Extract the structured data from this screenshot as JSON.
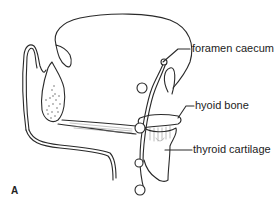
{
  "figure": {
    "panel_label": "A",
    "labels": {
      "foramen_caecum": "foramen caecum",
      "hyoid_bone": "hyoid bone",
      "thyroid_cartilage": "thyroid cartilage"
    },
    "colors": {
      "line": "#2a2a2a",
      "shade": "#888888",
      "background": "#ffffff"
    }
  }
}
